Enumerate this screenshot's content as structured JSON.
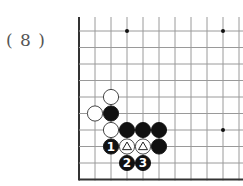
{
  "diagram": {
    "label": "( 8 )",
    "board": {
      "origin_x": 79,
      "origin_y": 31,
      "spacing_x": 16,
      "spacing_y": 16.5,
      "cols": 11,
      "rows": 10,
      "left_edge": true,
      "bottom_edge": true,
      "line_color": "#9a9a9a",
      "edge_color": "#333333",
      "star_points": [
        [
          3,
          0
        ],
        [
          9,
          0
        ],
        [
          9,
          6
        ]
      ]
    },
    "stones": [
      {
        "col": 2,
        "row": 4,
        "color": "white"
      },
      {
        "col": 1,
        "row": 5,
        "color": "white"
      },
      {
        "col": 2,
        "row": 5,
        "color": "black"
      },
      {
        "col": 2,
        "row": 6,
        "color": "white"
      },
      {
        "col": 3,
        "row": 6,
        "color": "black"
      },
      {
        "col": 4,
        "row": 6,
        "color": "black"
      },
      {
        "col": 5,
        "row": 6,
        "color": "black"
      },
      {
        "col": 2,
        "row": 7,
        "color": "black",
        "mark": "1"
      },
      {
        "col": 3,
        "row": 7,
        "color": "white",
        "mark": "triangle"
      },
      {
        "col": 4,
        "row": 7,
        "color": "white",
        "mark": "triangle"
      },
      {
        "col": 5,
        "row": 7,
        "color": "black"
      },
      {
        "col": 3,
        "row": 8,
        "color": "black",
        "mark": "2"
      },
      {
        "col": 4,
        "row": 8,
        "color": "black",
        "mark": "3"
      }
    ]
  }
}
